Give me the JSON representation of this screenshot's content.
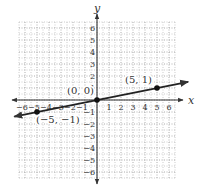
{
  "chart_data": {
    "type": "line",
    "title": "",
    "xlabel": "x",
    "ylabel": "y",
    "xlim": [
      -6,
      6
    ],
    "ylim": [
      -6,
      6
    ],
    "grid": true,
    "grid_style": "dotted",
    "x_ticks": [
      -6,
      -5,
      -4,
      -3,
      -2,
      -1,
      1,
      2,
      3,
      4,
      5,
      6
    ],
    "y_ticks": [
      -6,
      -5,
      -4,
      -3,
      -2,
      -1,
      1,
      2,
      3,
      4,
      5,
      6
    ],
    "series": [
      {
        "name": "line y = x/5",
        "equation": "y = (1/5)x",
        "x": [
          -5,
          0,
          5
        ],
        "y": [
          -1,
          0,
          1
        ],
        "arrows_both_ends": true
      }
    ],
    "points": [
      {
        "x": -5,
        "y": -1,
        "label": "(−5, −1)"
      },
      {
        "x": 0,
        "y": 0,
        "label": "(0, 0)"
      },
      {
        "x": 5,
        "y": 1,
        "label": "(5, 1)"
      }
    ],
    "colors": {
      "axis": "#333333",
      "grid": "#9a9a9a",
      "line": "#222222",
      "point": "#111111"
    }
  }
}
